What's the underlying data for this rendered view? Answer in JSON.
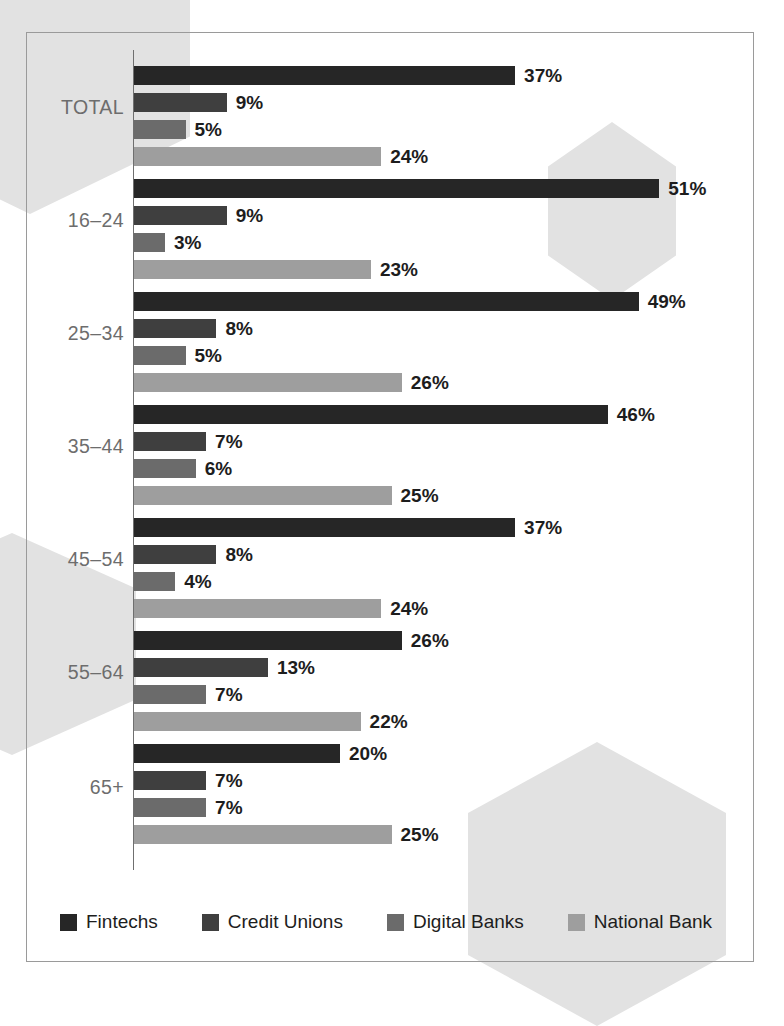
{
  "chart_data": {
    "type": "bar",
    "orientation": "horizontal",
    "title": "",
    "subtitle": "",
    "xlabel": "",
    "ylabel": "",
    "grid": false,
    "legend_position": "bottom",
    "xlim": [
      0,
      55
    ],
    "value_suffix": "%",
    "categories": [
      "TOTAL",
      "16–24",
      "25–34",
      "35–44",
      "45–54",
      "55–64",
      "65+"
    ],
    "series": [
      {
        "name": "Fintechs",
        "color": "#262626",
        "values": [
          37,
          51,
          49,
          46,
          37,
          26,
          20
        ],
        "labels": [
          "37%",
          "51%",
          "49%",
          "46%",
          "37%",
          "26%",
          "20%"
        ]
      },
      {
        "name": "Credit Unions",
        "color": "#3f3f3f",
        "values": [
          9,
          9,
          8,
          7,
          8,
          13,
          7
        ],
        "labels": [
          "9%",
          "9%",
          "8%",
          "7%",
          "8%",
          "13%",
          "7%"
        ]
      },
      {
        "name": "Digital Banks",
        "color": "#6b6b6b",
        "values": [
          5,
          3,
          5,
          6,
          4,
          7,
          7
        ],
        "labels": [
          "5%",
          "3%",
          "5%",
          "6%",
          "4%",
          "7%",
          "7%"
        ]
      },
      {
        "name": "National Bank",
        "color": "#9e9e9e",
        "values": [
          24,
          23,
          26,
          25,
          24,
          22,
          25
        ],
        "labels": [
          "24%",
          "23%",
          "26%",
          "25%",
          "24%",
          "22%",
          "25%"
        ]
      }
    ]
  },
  "legend": {
    "items": [
      {
        "label": "Fintechs",
        "color": "#262626"
      },
      {
        "label": "Credit Unions",
        "color": "#3f3f3f"
      },
      {
        "label": "Digital Banks",
        "color": "#6b6b6b"
      },
      {
        "label": "National Bank",
        "color": "#9e9e9e"
      }
    ]
  },
  "decor": {
    "hexagon_color": "#e2e2e2",
    "frame_color": "#9a9a9a",
    "axis_color": "#6f6f6f",
    "category_label_color": "#6d6d6d",
    "value_label_color": "#1d1d1d"
  }
}
